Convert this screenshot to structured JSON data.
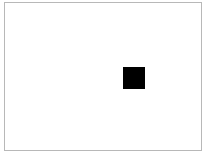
{
  "canvas": {
    "width": 207,
    "height": 156,
    "background_color": "#ffffff",
    "border_color": "#b8b8b8",
    "border_width": 1,
    "frame": {
      "x": 4,
      "y": 2,
      "width": 198,
      "height": 149
    }
  },
  "shapes": [
    {
      "name": "black-square",
      "type": "square",
      "fill_color": "#000000",
      "x": 122,
      "y": 66,
      "width": 22,
      "height": 22
    }
  ]
}
